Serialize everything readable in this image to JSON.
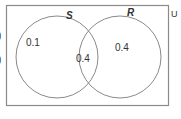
{
  "diagram": {
    "type": "venn",
    "universe_label": "U",
    "sets": [
      {
        "name": "S",
        "only_value": "0.1"
      },
      {
        "name": "R",
        "only_value": "0.4"
      }
    ],
    "intersection_value": "0.4",
    "left_margin_marks": [
      ")",
      ")"
    ]
  },
  "colors": {
    "line": "#8a8a8a",
    "text": "#333333",
    "background": "#ffffff"
  }
}
